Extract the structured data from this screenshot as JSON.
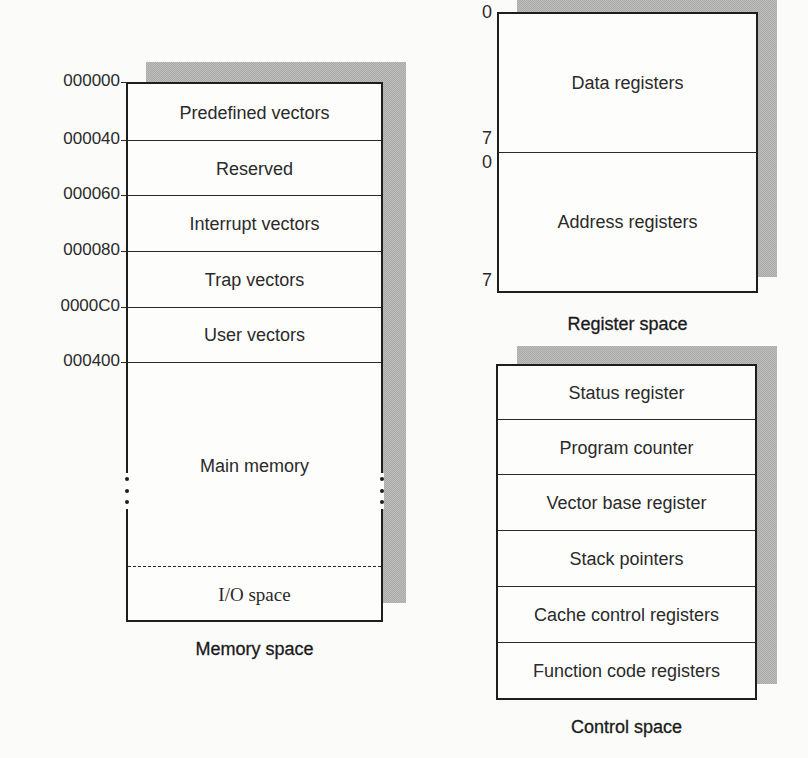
{
  "memory_space": {
    "caption": "Memory space",
    "regions": [
      {
        "start": "000000",
        "label": "Predefined vectors"
      },
      {
        "start": "000040",
        "label": "Reserved"
      },
      {
        "start": "000060",
        "label": "Interrupt vectors"
      },
      {
        "start": "000080",
        "label": "Trap vectors"
      },
      {
        "start": "0000C0",
        "label": "User vectors"
      },
      {
        "start": "000400",
        "label": "Main memory"
      },
      {
        "start": "",
        "label": "I/O space"
      }
    ]
  },
  "register_space": {
    "caption": "Register space",
    "groups": [
      {
        "label": "Data registers",
        "first_index": "0",
        "last_index": "7"
      },
      {
        "label": "Address registers",
        "first_index": "0",
        "last_index": "7"
      }
    ]
  },
  "control_space": {
    "caption": "Control space",
    "registers": [
      {
        "label": "Status register"
      },
      {
        "label": "Program counter"
      },
      {
        "label": "Vector base register"
      },
      {
        "label": "Stack pointers"
      },
      {
        "label": "Cache control registers"
      },
      {
        "label": "Function code registers"
      }
    ]
  }
}
